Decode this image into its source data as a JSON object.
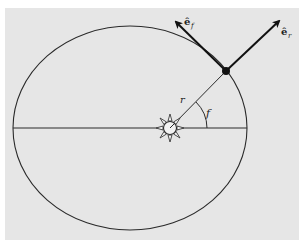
{
  "diagram": {
    "colors": {
      "background": "#ffffff",
      "panel": "#e6e6e6",
      "stroke": "#2a2a2a",
      "planet": "#111111"
    },
    "labels": {
      "radius": "r",
      "true_anomaly": "f",
      "unit_vector_f_base": "ê",
      "unit_vector_f_sub": "f",
      "unit_vector_r_base": "ê",
      "unit_vector_r_sub": "r"
    },
    "elements": {
      "orbit": "ellipse",
      "major_axis": "horizontal line through foci",
      "central_body": "sun-icon",
      "orbiting_body": "planet-dot",
      "radius_vector": "line from sun to planet",
      "angle_arc": "true anomaly f",
      "arrows": [
        "e_r radial unit vector",
        "e_f tangential unit vector"
      ]
    }
  }
}
